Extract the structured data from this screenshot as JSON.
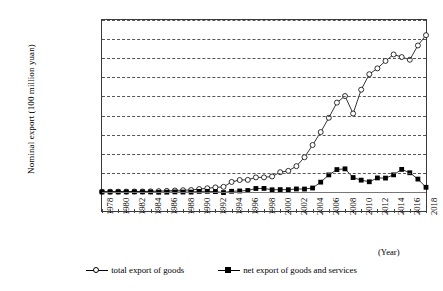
{
  "chart_data": {
    "type": "line",
    "title": "",
    "xlabel": "(Year)",
    "ylabel": "Nominal export (100 million yuan)",
    "xlim": [
      1978,
      2018
    ],
    "ylim": [
      -20000,
      180000
    ],
    "grid": true,
    "legend_position": "bottom",
    "x": [
      1978,
      1979,
      1980,
      1981,
      1982,
      1983,
      1984,
      1985,
      1986,
      1987,
      1988,
      1989,
      1990,
      1991,
      1992,
      1993,
      1994,
      1995,
      1996,
      1997,
      1998,
      1999,
      2000,
      2001,
      2002,
      2003,
      2004,
      2005,
      2006,
      2007,
      2008,
      2009,
      2010,
      2011,
      2012,
      2013,
      2014,
      2015,
      2016,
      2017,
      2018
    ],
    "xticks": [
      "1978",
      "1980",
      "1982",
      "1984",
      "1986",
      "1988",
      "1990",
      "1992",
      "1994",
      "1996",
      "1998",
      "2000",
      "2002",
      "2004",
      "2006",
      "2008",
      "2010",
      "2012",
      "2014",
      "2016",
      "2018"
    ],
    "yticks": [
      "-20000",
      "0",
      "20000",
      "40000",
      "60000",
      "80000",
      "100000",
      "120000",
      "140000",
      "160000",
      "180000"
    ],
    "series": [
      {
        "name": "total export of goods",
        "marker": "open-circle",
        "values": [
          168,
          212,
          272,
          368,
          414,
          438,
          580,
          809,
          1082,
          1470,
          1767,
          1956,
          2986,
          3827,
          4676,
          5285,
          10422,
          12452,
          12576,
          15161,
          15224,
          16160,
          20634,
          22024,
          26948,
          36288,
          49103,
          62648,
          77598,
          93456,
          100395,
          82030,
          107023,
          123241,
          129359,
          137131,
          143912,
          141167,
          138409,
          153321,
          164129
        ]
      },
      {
        "name": "net export of goods and services",
        "marker": "filled-square",
        "values": [
          -20,
          -30,
          -13,
          -13,
          80,
          40,
          -36,
          -367,
          -259,
          -11,
          -151,
          -185,
          510,
          617,
          272,
          -680,
          634,
          999,
          1459,
          3571,
          3644,
          2208,
          2390,
          2324,
          3094,
          2990,
          4079,
          10223,
          17790,
          23381,
          24135,
          15036,
          12304,
          10606,
          14627,
          14462,
          17853,
          23571,
          20053,
          13413,
          4813
        ]
      }
    ]
  },
  "axis": {
    "y_title": "Nominal export (100 million yuan)",
    "x_unit_label": "(Year)"
  },
  "legend": {
    "items": [
      {
        "label": "total export of goods",
        "marker": "open-circle-icon"
      },
      {
        "label": "net export of goods and services",
        "marker": "filled-square-icon"
      }
    ]
  }
}
